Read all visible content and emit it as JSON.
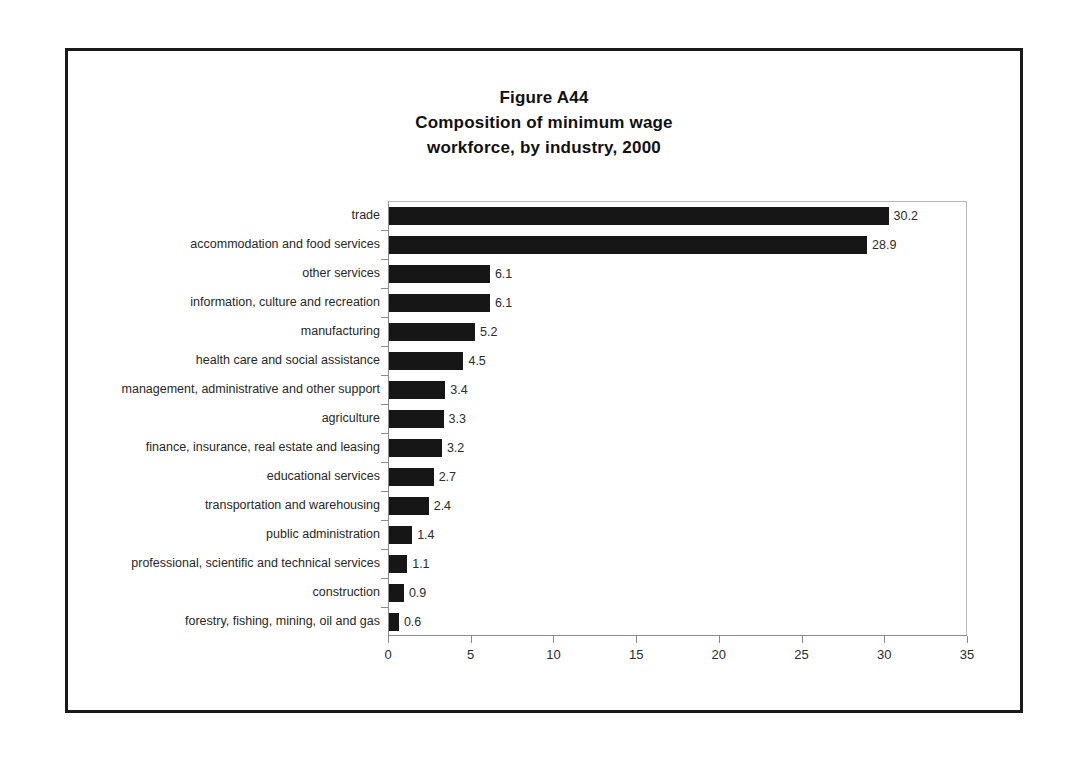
{
  "figure": {
    "title_lines": [
      "Figure A44",
      "Composition of minimum wage",
      "workforce, by industry, 2000"
    ]
  },
  "chart_data": {
    "type": "bar",
    "orientation": "horizontal",
    "title": "Figure A44 Composition of minimum wage workforce, by industry, 2000",
    "xlabel": "",
    "ylabel": "",
    "xlim": [
      0,
      35
    ],
    "xticks": [
      "0",
      "5",
      "10",
      "15",
      "20",
      "25",
      "30",
      "35"
    ],
    "grid": false,
    "legend": "none",
    "bar_color": "#161616",
    "categories": [
      "trade",
      "accommodation and food services",
      "other services",
      "information, culture and recreation",
      "manufacturing",
      "health care and social assistance",
      "management, administrative and other support",
      "agriculture",
      "finance, insurance, real estate and leasing",
      "educational services",
      "transportation and warehousing",
      "public administration",
      "professional, scientific and technical services",
      "construction",
      "forestry, fishing, mining, oil and gas"
    ],
    "values": [
      30.2,
      28.9,
      6.1,
      6.1,
      5.2,
      4.5,
      3.4,
      3.3,
      3.2,
      2.7,
      2.4,
      1.4,
      1.1,
      0.9,
      0.6
    ],
    "value_labels": [
      "30.2",
      "28.9",
      "6.1",
      "6.1",
      "5.2",
      "4.5",
      "3.4",
      "3.3",
      "3.2",
      "2.7",
      "2.4",
      "1.4",
      "1.1",
      "0.9",
      "0.6"
    ]
  }
}
